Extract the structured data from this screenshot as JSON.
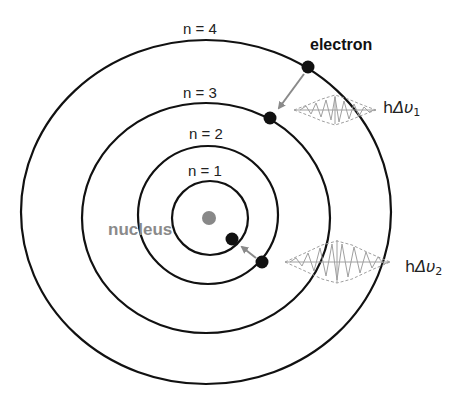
{
  "diagram": {
    "colors": {
      "orbit": "#111111",
      "electron": "#111111",
      "nucleus": "#888888",
      "arrow": "#8a8a8a",
      "wave": "#a0a0a0",
      "nucleus_label": "#8a8a8a"
    },
    "orbits": [
      {
        "label": "n = 1",
        "cx": 210,
        "cy": 218,
        "rx": 38,
        "ry": 37
      },
      {
        "label": "n = 2",
        "cx": 208,
        "cy": 215,
        "rx": 70,
        "ry": 69
      },
      {
        "label": "n = 3",
        "cx": 206,
        "cy": 218,
        "rx": 124,
        "ry": 115
      },
      {
        "label": "n = 4",
        "cx": 206,
        "cy": 212,
        "rx": 185,
        "ry": 172
      }
    ],
    "nucleus": {
      "label": "nucleus",
      "cx": 209,
      "cy": 218,
      "r": 7
    },
    "electrons": [
      {
        "orbit": "n = 4",
        "cx": 308,
        "cy": 67
      },
      {
        "orbit": "n = 3",
        "cx": 270,
        "cy": 118
      },
      {
        "orbit": "n = 1",
        "cx": 232,
        "cy": 239
      },
      {
        "orbit": "n = 2",
        "cx": 262,
        "cy": 262
      }
    ],
    "transitions": [
      {
        "from": "n = 4",
        "to": "n = 3",
        "photon_label": {
          "h": "h",
          "delta": "Δ",
          "nu": "υ",
          "sub": "1"
        }
      },
      {
        "from": "n = 2",
        "to": "n = 1",
        "photon_label": {
          "h": "h",
          "delta": "Δ",
          "nu": "υ",
          "sub": "2"
        }
      }
    ],
    "electron_label": "electron"
  }
}
